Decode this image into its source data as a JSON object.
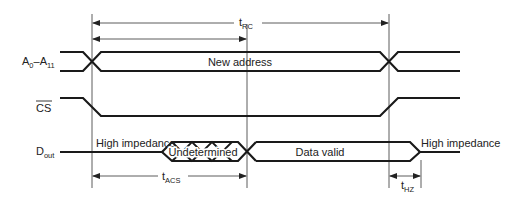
{
  "diagram": {
    "type": "timing-diagram",
    "signals": [
      {
        "name": "A",
        "sub_start": "0",
        "dash": "–",
        "name2": "A",
        "sub_end": "11",
        "full": "A0–A11",
        "bus_label": "New address"
      },
      {
        "name": "CS",
        "overline": true
      },
      {
        "name": "D",
        "sub": "out",
        "segments": [
          "High impedance",
          "Undetermined",
          "Data valid",
          "High impedance"
        ]
      }
    ],
    "timings": [
      {
        "name": "t",
        "sub": "RC"
      },
      {
        "name": "t",
        "sub": "ACS"
      },
      {
        "name": "t",
        "sub": "HZ"
      }
    ],
    "colors": {
      "line": "#1a1a1a",
      "background": "#ffffff"
    }
  }
}
